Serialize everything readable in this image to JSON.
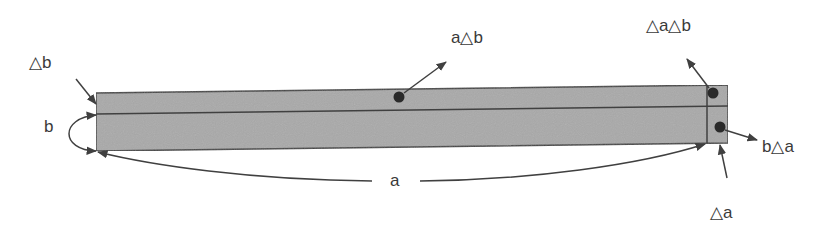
{
  "diagram": {
    "colors": {
      "fill": "#a8a8a8",
      "stroke": "#404040",
      "dot": "#2a2a2a",
      "text": "#3a3a3a",
      "background": "#ffffff"
    },
    "labels": {
      "delta_b": "△b",
      "b": "b",
      "a": "a",
      "a_delta_b": "a△b",
      "delta_a_delta_b": "△a△b",
      "b_delta_a": "b△a",
      "delta_a": "△a"
    },
    "regions": [
      {
        "name": "a·b",
        "description": "main rectangle (lower-left)"
      },
      {
        "name": "a△b",
        "description": "thin top strip"
      },
      {
        "name": "b△a",
        "description": "thin right strip"
      },
      {
        "name": "△a△b",
        "description": "small top-right corner"
      }
    ]
  }
}
